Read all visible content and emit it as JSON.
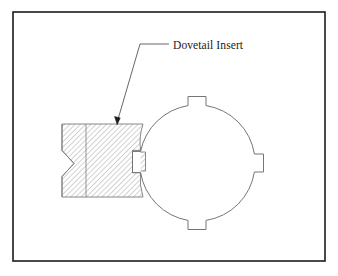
{
  "figure": {
    "background_color": "#ffffff",
    "border": {
      "name": "drawing-frame",
      "color": "#1c1c1c",
      "x": 13,
      "y": 12,
      "width": 312,
      "height": 249,
      "stroke_width": 1.6
    }
  },
  "annotation": {
    "label": "Dovetail Insert",
    "text_x": 172,
    "text_y": 49,
    "leader": {
      "name": "leader-line",
      "color": "#3a3a3a",
      "horizontal_start_x": 168,
      "horizontal_end_x": 140,
      "horizontal_y": 44,
      "diagonal_end_x": 117,
      "diagonal_end_y": 122
    },
    "arrowhead": {
      "name": "leader-arrowhead",
      "tip_x": 117,
      "tip_y": 124,
      "color": "#1a1a1a"
    }
  },
  "parts": {
    "circular_body": {
      "name": "circular-body",
      "center_x": 197,
      "center_y": 163,
      "radius": 58,
      "stroke": "#6e6e6e",
      "fill": "#ffffff",
      "tabs": [
        {
          "name": "tab-top",
          "position": "top",
          "width": 18,
          "height": 9
        },
        {
          "name": "tab-right",
          "position": "right",
          "width": 9,
          "height": 18
        },
        {
          "name": "tab-bottom",
          "position": "bottom",
          "width": 18,
          "height": 9
        },
        {
          "name": "tab-left",
          "position": "left",
          "width": 11,
          "height": 17
        }
      ]
    },
    "dovetail_insert": {
      "name": "dovetail-insert",
      "stroke": "#7a7a7a",
      "hatch_color": "#9a9a9a",
      "hatch_angle_deg": 45,
      "hatch_spacing": 2.6,
      "block_left_x": 86,
      "block_right_x": 140,
      "block_top_y": 124,
      "block_bottom_y": 197,
      "tail_left_x": 62,
      "tail_notch_depth": 10
    }
  }
}
